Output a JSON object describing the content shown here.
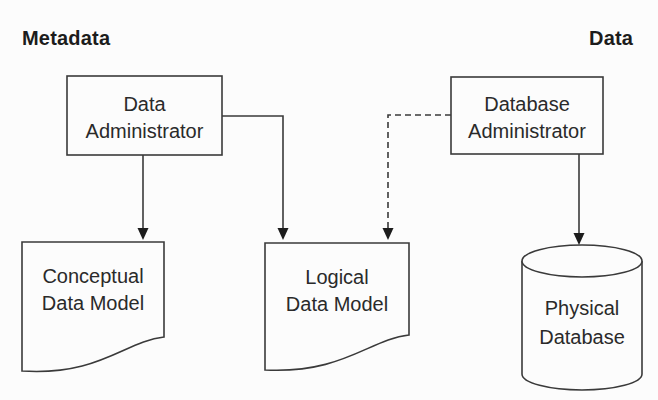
{
  "diagram": {
    "corner_labels": {
      "left": "Metadata",
      "right": "Data"
    },
    "nodes": {
      "data_administrator": {
        "type": "process-box",
        "lines": [
          "Data",
          "Administrator"
        ]
      },
      "database_administrator": {
        "type": "process-box",
        "lines": [
          "Database",
          "Administrator"
        ]
      },
      "conceptual_data_model": {
        "type": "document",
        "lines": [
          "Conceptual",
          "Data Model"
        ]
      },
      "logical_data_model": {
        "type": "document",
        "lines": [
          "Logical",
          "Data Model"
        ]
      },
      "physical_database": {
        "type": "cylinder",
        "lines": [
          "Physical",
          "Database"
        ]
      }
    },
    "edges": [
      {
        "from": "data_administrator",
        "to": "conceptual_data_model",
        "style": "solid",
        "arrow": "filled"
      },
      {
        "from": "data_administrator",
        "to": "logical_data_model",
        "style": "solid",
        "arrow": "filled"
      },
      {
        "from": "database_administrator",
        "to": "logical_data_model",
        "style": "dashed",
        "arrow": "filled"
      },
      {
        "from": "database_administrator",
        "to": "physical_database",
        "style": "solid",
        "arrow": "filled"
      }
    ],
    "colors": {
      "line": "#3a3a3a",
      "text": "#2a2a2a",
      "background": "#fcfcfc",
      "shape_fill": "#fcfcfc"
    }
  }
}
